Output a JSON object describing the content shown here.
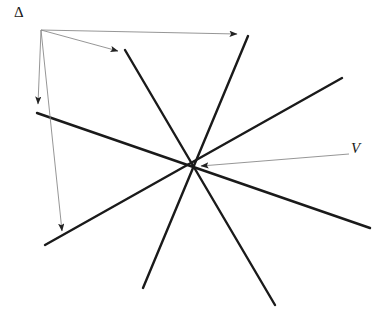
{
  "figure": {
    "canvas": {
      "width": 384,
      "height": 322,
      "background": "#ffffff"
    },
    "styles": {
      "line_color": "#1a1a1a",
      "line_width": 2.4,
      "arrow_color": "#8a8a8a",
      "arrow_width": 0.9,
      "label_color": "#1a1a1a"
    },
    "labels": [
      {
        "name": "delta-label",
        "text": "Δ",
        "x": 14,
        "y": 5
      },
      {
        "name": "v-label",
        "text": "V",
        "x": 351,
        "y": 141
      }
    ],
    "vertex": {
      "name": "V",
      "x": 195,
      "y": 167
    },
    "lines": [
      {
        "name": "line-1",
        "x1": 37,
        "y1": 113,
        "x2": 370,
        "y2": 228
      },
      {
        "name": "line-2",
        "x1": 45,
        "y1": 245,
        "x2": 342,
        "y2": 78
      },
      {
        "name": "line-3",
        "x1": 125,
        "y1": 50,
        "x2": 275,
        "y2": 305
      },
      {
        "name": "line-4",
        "x1": 248,
        "y1": 36,
        "x2": 143,
        "y2": 288
      }
    ],
    "arrows": [
      {
        "name": "arrow-to-line-2",
        "x1": 41,
        "y1": 30,
        "x2": 62,
        "y2": 231
      },
      {
        "name": "arrow-to-line-1",
        "x1": 41,
        "y1": 30,
        "x2": 38,
        "y2": 104
      },
      {
        "name": "arrow-to-line-3",
        "x1": 41,
        "y1": 30,
        "x2": 118,
        "y2": 51
      },
      {
        "name": "arrow-to-line-4",
        "x1": 41,
        "y1": 30,
        "x2": 237,
        "y2": 34
      },
      {
        "name": "arrow-to-vertex",
        "x1": 349,
        "y1": 154,
        "x2": 201,
        "y2": 166
      }
    ]
  }
}
